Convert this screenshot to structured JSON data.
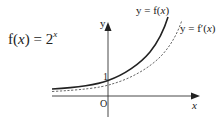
{
  "figure": {
    "function_definition": {
      "prefix": "f(",
      "var": "x",
      "mid": ") = 2",
      "exp": "x"
    },
    "curve_labels": {
      "f": {
        "text_prefix": "y = f(",
        "var": "x",
        "suffix": ")"
      },
      "fprime": {
        "text_prefix": "y = f′(",
        "var": "x",
        "suffix": ")"
      }
    },
    "axes": {
      "x_label": "x",
      "y_label": "y",
      "origin_label": "O",
      "y_intercept_label": "1"
    },
    "colors": {
      "axis": "#333333",
      "curve": "#222222",
      "dashed": "#555555"
    }
  }
}
